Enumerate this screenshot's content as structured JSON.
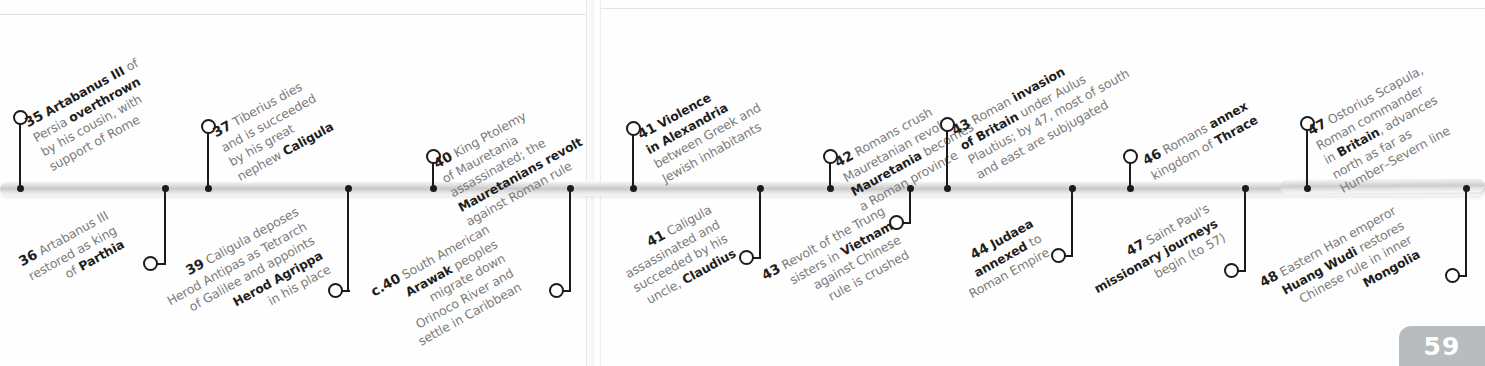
{
  "page": {
    "number": "59",
    "era_note": ""
  },
  "timeline": {
    "orientation": "horizontal",
    "bar_color": "#c9c9c9",
    "marker_color": "#1b1b1b",
    "text_color": "#7b7b7b",
    "emphasis_color": "#1e1e1e"
  },
  "events_above": [
    {
      "year": "35",
      "lines": [
        {
          "text": "Artabanus III of",
          "bold_prefix": "Artabanus III",
          "rest": " of"
        },
        {
          "text": "Persia overthrown",
          "plain": "Persia ",
          "bold": "overthrown"
        },
        {
          "text": "by his cousin, with"
        },
        {
          "text": "support of Rome"
        }
      ],
      "full_text": "35 Artabanus III of Persia overthrown by his cousin, with support of Rome"
    },
    {
      "year": "37",
      "lines": [
        {
          "text": "Tiberius dies"
        },
        {
          "text": "and is succeeded"
        },
        {
          "text": "by his great"
        },
        {
          "text": "nephew Caligula",
          "plain": "nephew ",
          "bold": "Caligula"
        }
      ],
      "full_text": "37 Tiberius dies and is succeeded by his great nephew Caligula"
    },
    {
      "year": "40",
      "lines": [
        {
          "text": "King Ptolemy"
        },
        {
          "text": "of Mauretania"
        },
        {
          "text": "assassinated; the"
        },
        {
          "text": "Mauretanians revolt",
          "bold": "Mauretanians revolt"
        },
        {
          "text": "against Roman rule"
        }
      ],
      "full_text": "40 King Ptolemy of Mauretania assassinated; the Mauretanians revolt against Roman rule"
    },
    {
      "year": "41",
      "lines": [
        {
          "text": "Violence",
          "bold": "Violence"
        },
        {
          "text": "in Alexandria",
          "bold": "in Alexandria"
        },
        {
          "text": "between Greek and"
        },
        {
          "text": "Jewish inhabitants"
        }
      ],
      "full_text": "41 Violence in Alexandria between Greek and Jewish inhabitants"
    },
    {
      "year": "42",
      "lines": [
        {
          "text": "Romans crush"
        },
        {
          "text": "Mauretanian revolt;"
        },
        {
          "text": "Mauretania becomes",
          "bold": "Mauretania",
          "plain": " becomes"
        },
        {
          "text": "a Roman province"
        }
      ],
      "full_text": "42 Romans crush Mauretanian revolt; Mauretania becomes a Roman province"
    },
    {
      "year": "43",
      "lines": [
        {
          "text": "Roman invasion",
          "plain": "Roman ",
          "bold": "invasion"
        },
        {
          "text": "of Britain under Aulus",
          "bold": "of Britain",
          "plain": " under Aulus"
        },
        {
          "text": "Plautius; by 47, most of south"
        },
        {
          "text": "and east are subjugated"
        }
      ],
      "full_text": "43 Roman invasion of Britain under Aulus Plautius; by 47, most of south and east are subjugated"
    },
    {
      "year": "46",
      "lines": [
        {
          "text": "Romans annex",
          "plain": "Romans ",
          "bold": "annex"
        },
        {
          "text": "kingdom of Thrace",
          "plain": "kingdom of ",
          "bold": "Thrace"
        }
      ],
      "full_text": "46 Romans annex kingdom of Thrace"
    },
    {
      "year": "47",
      "lines": [
        {
          "text": "Ostorius Scapula,"
        },
        {
          "text": "Roman commander"
        },
        {
          "text": "in Britain, advances",
          "plain": "in ",
          "bold": "Britain",
          "rest": ", advances"
        },
        {
          "text": "north as far as"
        },
        {
          "text": "Humber–Severn line"
        }
      ],
      "full_text": "47 Ostorius Scapula, Roman commander in Britain, advances north as far as Humber–Severn line"
    }
  ],
  "events_below": [
    {
      "year": "36",
      "lines": [
        {
          "text": "Artabanus III"
        },
        {
          "text": "restored as king"
        },
        {
          "text": "of Parthia",
          "plain": "of ",
          "bold": "Parthia"
        }
      ],
      "full_text": "36 Artabanus III restored as king of Parthia"
    },
    {
      "year": "39",
      "lines": [
        {
          "text": "Caligula deposes"
        },
        {
          "text": "Herod Antipas as Tetrarch"
        },
        {
          "text": "of Galilee and appoints"
        },
        {
          "text": "Herod Agrippa",
          "bold": "Herod Agrippa"
        },
        {
          "text": "in his place"
        }
      ],
      "full_text": "39 Caligula deposes Herod Antipas as Tetrarch of Galilee and appoints Herod Agrippa in his place"
    },
    {
      "year": "c.40",
      "lines": [
        {
          "text": "South American"
        },
        {
          "text": "Arawak peoples",
          "bold": "Arawak",
          "plain": " peoples"
        },
        {
          "text": "migrate down"
        },
        {
          "text": "Orinoco River and"
        },
        {
          "text": "settle in Caribbean"
        }
      ],
      "full_text": "c.40 South American Arawak peoples migrate down Orinoco River and settle in Caribbean"
    },
    {
      "year": "41",
      "lines": [
        {
          "text": "Caligula"
        },
        {
          "text": "assassinated and"
        },
        {
          "text": "succeeded by his"
        },
        {
          "text": "uncle, Claudius",
          "plain": "uncle, ",
          "bold": "Claudius"
        }
      ],
      "full_text": "41 Caligula assassinated and succeeded by his uncle, Claudius"
    },
    {
      "year": "43",
      "lines": [
        {
          "text": "Revolt of the Trung"
        },
        {
          "text": "sisters in Vietnam",
          "plain": "sisters in ",
          "bold": "Vietnam"
        },
        {
          "text": "against Chinese"
        },
        {
          "text": "rule is crushed"
        }
      ],
      "full_text": "43 Revolt of the Trung sisters in Vietnam against Chinese rule is crushed"
    },
    {
      "year": "44",
      "lines": [
        {
          "text": "Judaea",
          "bold": "Judaea"
        },
        {
          "text": "annexed to",
          "bold": "annexed",
          "plain": " to"
        },
        {
          "text": "Roman Empire"
        }
      ],
      "full_text": "44 Judaea annexed to Roman Empire"
    },
    {
      "year": "47",
      "lines": [
        {
          "text": "Saint Paul's"
        },
        {
          "text": "missionary journeys",
          "bold": "missionary journeys"
        },
        {
          "text": "begin (to 57)"
        }
      ],
      "full_text": "47 Saint Paul's missionary journeys begin (to 57)"
    },
    {
      "year": "48",
      "lines": [
        {
          "text": "Eastern Han emperor"
        },
        {
          "text": "Huang Wudi restores",
          "bold": "Huang Wudi",
          "plain": " restores"
        },
        {
          "text": "Chinese rule in inner"
        },
        {
          "text": "Mongolia",
          "bold": "Mongolia"
        }
      ],
      "full_text": "48 Eastern Han emperor Huang Wudi restores Chinese rule in inner Mongolia"
    }
  ]
}
